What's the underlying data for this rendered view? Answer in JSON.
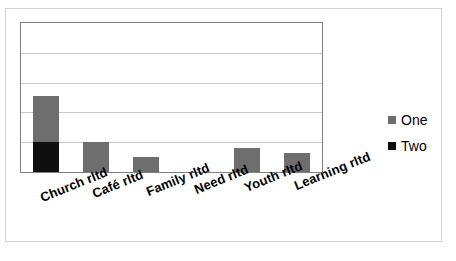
{
  "chart_data": {
    "type": "bar",
    "subtype": "stacked-column",
    "title": "",
    "xlabel": "",
    "ylabel": "",
    "ylim": [
      0,
      5
    ],
    "ytick_count": 5,
    "grid": true,
    "legend_position": "right",
    "categories": [
      "Church rltd",
      "Café rltd",
      "Family rltd",
      "Need rltd",
      "Youth rltd",
      "Learning rltd"
    ],
    "series": [
      {
        "name": "One",
        "color": "#6e6e6e",
        "values": [
          1.55,
          1.0,
          0.5,
          0,
          0.8,
          0.65
        ]
      },
      {
        "name": "Two",
        "color": "#0f0f0f",
        "values": [
          1.0,
          0,
          0,
          0,
          0,
          0
        ]
      }
    ]
  },
  "legend": {
    "items": [
      {
        "label": "One",
        "swatch": "gray-square"
      },
      {
        "label": "Two",
        "swatch": "black-square"
      }
    ]
  }
}
